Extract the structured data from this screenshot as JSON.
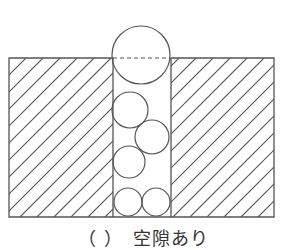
{
  "diagram": {
    "stroke_color": "#555555",
    "block": {
      "x": 9,
      "y": 58,
      "width": 265,
      "height": 159
    },
    "channel": {
      "x1": 113,
      "x2": 171
    },
    "hatch_spacing": 17,
    "circles": [
      {
        "cx": 141,
        "cy": 55,
        "r": 29
      },
      {
        "cx": 130,
        "cy": 110,
        "r": 18
      },
      {
        "cx": 152,
        "cy": 137,
        "r": 17
      },
      {
        "cx": 129,
        "cy": 162,
        "r": 16
      },
      {
        "cx": 128,
        "cy": 202,
        "r": 14
      },
      {
        "cx": 156,
        "cy": 202,
        "r": 14
      }
    ],
    "dashed_line": {
      "y": 58
    }
  },
  "caption": "（ ）　空隙あり"
}
